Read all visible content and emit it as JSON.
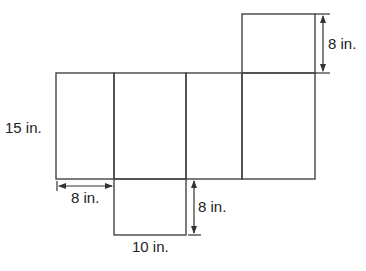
{
  "diagram": {
    "type": "rectangular prism net",
    "stroke_color": "#444444",
    "labels": {
      "top_height": "8 in.",
      "left_height": "15 in.",
      "left_width": "8 in.",
      "bottom_height": "8 in.",
      "bottom_width": "10 in."
    },
    "dimensions": {
      "length_in": 10,
      "width_in": 8,
      "height_in": 15
    }
  }
}
